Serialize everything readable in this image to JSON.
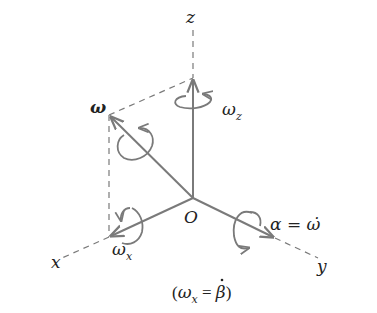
{
  "diagram": {
    "type": "3D angular velocity vector decomposition",
    "colors": {
      "line": "#7a7a7a",
      "text": "#222222",
      "background": "#ffffff"
    },
    "origin": {
      "label": "O"
    },
    "axes": [
      {
        "id": "x",
        "label": "x"
      },
      {
        "id": "y",
        "label": "y"
      },
      {
        "id": "z",
        "label": "z"
      }
    ],
    "vectors": [
      {
        "id": "omega",
        "label": "ω",
        "description": "total angular velocity"
      },
      {
        "id": "omega_z",
        "label": "ω",
        "subscript": "z",
        "description": "component along z"
      },
      {
        "id": "omega_x",
        "label": "ω",
        "subscript": "x",
        "description": "component along x"
      },
      {
        "id": "alpha",
        "label": "α = ω̇",
        "description": "angular acceleration along y"
      }
    ],
    "caption": {
      "open": "(",
      "omega": "ω",
      "sub": "x",
      "eq": " = ",
      "beta": "β",
      "close": ")"
    }
  }
}
